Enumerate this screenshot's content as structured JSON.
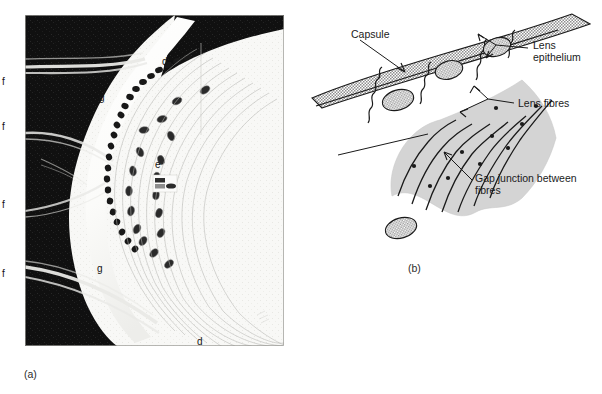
{
  "figure": {
    "panels": [
      {
        "id": "a",
        "caption": "(a)",
        "type": "electron-micrograph",
        "labels": [
          {
            "key": "f1",
            "text": "f",
            "x": 10,
            "y": 77
          },
          {
            "key": "f2",
            "text": "f",
            "x": 10,
            "y": 122
          },
          {
            "key": "f3",
            "text": "f",
            "x": 10,
            "y": 200
          },
          {
            "key": "f4",
            "text": "f",
            "x": 10,
            "y": 269
          },
          {
            "key": "d-top",
            "text": "d",
            "x": 162,
            "y": 57
          },
          {
            "key": "g-upper",
            "text": "g",
            "x": 99,
            "y": 93
          },
          {
            "key": "e",
            "text": "e",
            "x": 155,
            "y": 160
          },
          {
            "key": "g-lower",
            "text": "g",
            "x": 97,
            "y": 264
          },
          {
            "key": "d-bottom",
            "text": "d",
            "x": 197,
            "y": 337
          }
        ]
      },
      {
        "id": "b",
        "caption": "(b)",
        "type": "line-diagram",
        "labels": [
          {
            "key": "capsule",
            "text": "Capsule",
            "x": 51,
            "y": 28
          },
          {
            "key": "lens-epithelium",
            "text": "Lens\nepithelium",
            "x": 233,
            "y": 39
          },
          {
            "key": "lens-fibres",
            "text": "Lens fibres",
            "x": 218,
            "y": 99
          },
          {
            "key": "gap-junction",
            "text": "Gap junction between\nfibres",
            "x": 175,
            "y": 172
          }
        ]
      }
    ]
  },
  "colors": {
    "capsule_fill": "#a8a8a8",
    "fibre_fill": "#d2d2d2",
    "nucleus_fill": "#b0b0b0",
    "stroke": "#1a1a1a",
    "micrograph_dark": "#121212",
    "micrograph_light": "#f7f7f5",
    "page_background": "#ffffff"
  }
}
